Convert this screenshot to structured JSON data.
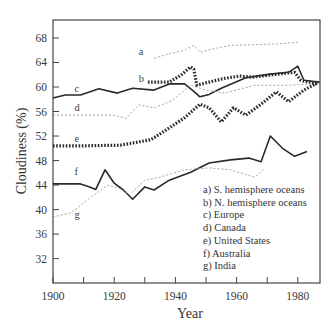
{
  "chart_data": {
    "type": "line",
    "title": "",
    "xlabel": "Year",
    "ylabel": "Cloudiness (%)",
    "xlim": [
      1900,
      1987
    ],
    "ylim": [
      28,
      72
    ],
    "xticks": [
      1900,
      1910,
      1920,
      1930,
      1940,
      1950,
      1960,
      1970,
      1980
    ],
    "xtick_labels": [
      "1900",
      "1920",
      "1940",
      "1960",
      "1980"
    ],
    "yticks": [
      32,
      36,
      40,
      44,
      48,
      52,
      56,
      60,
      64,
      68
    ],
    "ytick_labels": [
      "32",
      "36",
      "40",
      "44",
      "48",
      "52",
      "56",
      "60",
      "64",
      "68"
    ],
    "grid": false,
    "legend_position": "lower right (inside)",
    "series": [
      {
        "key": "a",
        "name": "S. hemisphere oceans",
        "style": "light-dashed",
        "label_pos": [
          1928,
          65.3
        ],
        "x": [
          1933,
          1938,
          1943,
          1946,
          1948,
          1952,
          1958,
          1965,
          1972,
          1980
        ],
        "y": [
          64.7,
          65.4,
          66.0,
          66.8,
          65.7,
          66.2,
          66.8,
          66.9,
          67.0,
          67.3
        ]
      },
      {
        "key": "b",
        "name": "N. hemisphere oceans",
        "style": "bold-dotted",
        "label_pos": [
          1928,
          60.8
        ],
        "x": [
          1931,
          1938,
          1942,
          1945,
          1946,
          1947,
          1951,
          1956,
          1961,
          1965,
          1970,
          1977,
          1979,
          1981,
          1986
        ],
        "y": [
          60.8,
          60.8,
          62.0,
          63.3,
          62.9,
          60.3,
          60.8,
          61.4,
          61.8,
          61.6,
          61.9,
          62.3,
          62.4,
          61.1,
          60.5
        ]
      },
      {
        "key": "c",
        "name": "Europe",
        "style": "solid",
        "label_pos": [
          1907,
          59.2
        ],
        "x": [
          1900,
          1904,
          1909,
          1915,
          1921,
          1926,
          1933,
          1938,
          1943,
          1946,
          1948,
          1951,
          1955,
          1963,
          1971,
          1977,
          1980,
          1982,
          1987
        ],
        "y": [
          58.2,
          58.7,
          58.7,
          59.7,
          59.0,
          59.8,
          59.5,
          60.5,
          60.5,
          59.3,
          58.4,
          58.8,
          59.8,
          61.5,
          62.1,
          62.4,
          63.4,
          61.1,
          60.8
        ]
      },
      {
        "key": "d",
        "name": "Canada",
        "style": "light-dashed",
        "label_pos": [
          1907,
          56.1
        ],
        "x": [
          1900,
          1910,
          1920,
          1924,
          1928,
          1933,
          1939,
          1945,
          1950,
          1956,
          1966,
          1977,
          1986
        ],
        "y": [
          55.4,
          55.4,
          55.4,
          54.9,
          57.1,
          56.6,
          57.8,
          60.3,
          59.5,
          59.0,
          60.3,
          60.3,
          60.5
        ]
      },
      {
        "key": "e",
        "name": "United States",
        "style": "bold-dotted",
        "label_pos": [
          1907,
          51.0
        ],
        "x": [
          1900,
          1910,
          1922,
          1932,
          1937,
          1943,
          1948,
          1951,
          1955,
          1959,
          1963,
          1968,
          1973,
          1977,
          1982,
          1987
        ],
        "y": [
          50.4,
          50.4,
          50.5,
          51.4,
          53.0,
          55.0,
          57.2,
          56.6,
          54.3,
          56.6,
          55.4,
          57.2,
          59.2,
          57.6,
          59.5,
          60.8
        ]
      },
      {
        "key": "f",
        "name": "Australia",
        "style": "solid",
        "label_pos": [
          1907,
          45.6
        ],
        "x": [
          1900,
          1909,
          1912,
          1914,
          1917,
          1920,
          1923,
          1926,
          1930,
          1933,
          1938,
          1945,
          1951,
          1958,
          1964,
          1968,
          1971,
          1975,
          1979,
          1983
        ],
        "y": [
          44.2,
          44.2,
          43.7,
          43.3,
          46.5,
          44.3,
          43.2,
          41.7,
          43.7,
          43.2,
          44.8,
          46.1,
          47.6,
          48.1,
          48.4,
          47.8,
          52.0,
          50.0,
          48.7,
          49.5
        ]
      },
      {
        "key": "g",
        "name": "India",
        "style": "light-dashed",
        "label_pos": [
          1907,
          38.6
        ],
        "x": [
          1900,
          1906,
          1912,
          1918,
          1922,
          1925,
          1930,
          1935,
          1943,
          1951,
          1958,
          1963,
          1966,
          1969
        ],
        "y": [
          38.8,
          39.5,
          41.9,
          44.0,
          43.4,
          42.4,
          44.8,
          45.3,
          46.5,
          46.8,
          46.5,
          45.7,
          45.3,
          46.6
        ]
      }
    ],
    "legend": [
      "a) S. hemisphere oceans",
      "b) N. hemisphere oceans",
      "c) Europe",
      "d) Canada",
      "e) United States",
      "f) Australia",
      "g) India"
    ]
  }
}
